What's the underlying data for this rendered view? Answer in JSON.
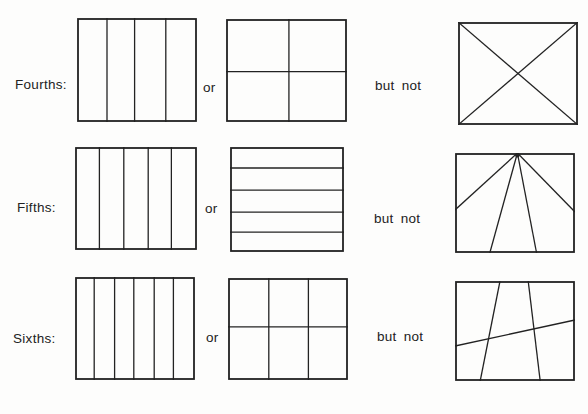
{
  "canvas": {
    "width": 588,
    "height": 414,
    "background": "#fdfdfc",
    "ink": "#222222"
  },
  "rows": [
    {
      "name": "fourths",
      "label": "Fourths:",
      "label_pos": {
        "x": 15,
        "y": 84
      },
      "or_label": "or",
      "or_pos": {
        "x": 203,
        "y": 87
      },
      "but_not_label": "but not",
      "but_not_pos": {
        "x": 375,
        "y": 85
      },
      "figures": [
        {
          "name": "fourths-four-vertical-strips",
          "role": "correct-example-1",
          "desc": "square divided into 4 vertical strips",
          "box": [
            77,
            18,
            120,
            104
          ],
          "segments": [
            [
              0.25,
              0,
              0.25,
              1
            ],
            [
              0.48,
              0,
              0.48,
              1
            ],
            [
              0.74,
              0,
              0.74,
              1
            ]
          ]
        },
        {
          "name": "fourths-two-by-two-grid",
          "role": "correct-example-2",
          "desc": "square divided into 4 quadrants",
          "box": [
            226,
            19,
            121,
            103
          ],
          "segments": [
            [
              0.52,
              0,
              0.52,
              1
            ],
            [
              0,
              0.51,
              1,
              0.51
            ]
          ]
        },
        {
          "name": "fourths-diagonal-x",
          "role": "non-example",
          "desc": "square divided by two corner-to-corner diagonals",
          "box": [
            458,
            22,
            120,
            103
          ],
          "segments": [
            [
              0,
              0,
              1,
              1
            ],
            [
              1,
              0,
              0,
              1
            ]
          ]
        }
      ]
    },
    {
      "name": "fifths",
      "label": "Fifths:",
      "label_pos": {
        "x": 17,
        "y": 207
      },
      "or_label": "or",
      "or_pos": {
        "x": 205,
        "y": 208
      },
      "but_not_label": "but not",
      "but_not_pos": {
        "x": 374,
        "y": 218
      },
      "figures": [
        {
          "name": "fifths-five-vertical-strips",
          "role": "correct-example-1",
          "desc": "square divided into 5 vertical strips",
          "box": [
            75,
            147,
            122,
            103
          ],
          "segments": [
            [
              0.2,
              0,
              0.2,
              1
            ],
            [
              0.4,
              0,
              0.4,
              1
            ],
            [
              0.6,
              0,
              0.6,
              1
            ],
            [
              0.79,
              0,
              0.79,
              1
            ]
          ]
        },
        {
          "name": "fifths-five-horizontal-strips",
          "role": "correct-example-2",
          "desc": "square divided into 5 horizontal strips",
          "box": [
            230,
            147,
            114,
            105
          ],
          "segments": [
            [
              0,
              0.2,
              1,
              0.2
            ],
            [
              0,
              0.41,
              1,
              0.41
            ],
            [
              0,
              0.62,
              1,
              0.62
            ],
            [
              0,
              0.81,
              1,
              0.81
            ]
          ]
        },
        {
          "name": "fifths-fan-from-top-center",
          "role": "non-example",
          "desc": "square divided by 4 lines fanning out from one point at top center",
          "box": [
            455,
            153,
            120,
            100
          ],
          "segments": [
            [
              0.52,
              0,
              0,
              0.57
            ],
            [
              0.52,
              0,
              0.29,
              1
            ],
            [
              0.52,
              0,
              0.68,
              1
            ],
            [
              0.52,
              0,
              1,
              0.59
            ]
          ],
          "dot": [
            0.52,
            0
          ]
        }
      ]
    },
    {
      "name": "sixths",
      "label": "Sixths:",
      "label_pos": {
        "x": 13,
        "y": 338
      },
      "or_label": "or",
      "or_pos": {
        "x": 206,
        "y": 337
      },
      "but_not_label": "but not",
      "but_not_pos": {
        "x": 377,
        "y": 336
      },
      "figures": [
        {
          "name": "sixths-six-vertical-strips",
          "role": "correct-example-1",
          "desc": "square divided into 6 vertical strips",
          "box": [
            75,
            277,
            120,
            103
          ],
          "segments": [
            [
              0.16,
              0,
              0.16,
              1
            ],
            [
              0.33,
              0,
              0.33,
              1
            ],
            [
              0.49,
              0,
              0.49,
              1
            ],
            [
              0.66,
              0,
              0.66,
              1
            ],
            [
              0.82,
              0,
              0.82,
              1
            ]
          ]
        },
        {
          "name": "sixths-three-by-two-grid",
          "role": "correct-example-2",
          "desc": "square divided into a 3 x 2 grid of 6 cells",
          "box": [
            228,
            278,
            120,
            102
          ],
          "segments": [
            [
              0.34,
              0,
              0.34,
              1
            ],
            [
              0.67,
              0,
              0.67,
              1
            ],
            [
              0,
              0.48,
              1,
              0.48
            ]
          ]
        },
        {
          "name": "sixths-irregular-slanted-lines",
          "role": "non-example",
          "desc": "square divided by two slanted near-vertical lines and one slanted near-horizontal line into 6 unequal regions",
          "box": [
            455,
            281,
            120,
            100
          ],
          "segments": [
            [
              0.375,
              0,
              0.21,
              1
            ],
            [
              0.61,
              0,
              0.71,
              1
            ],
            [
              0,
              0.65,
              1,
              0.39
            ]
          ]
        }
      ]
    }
  ]
}
